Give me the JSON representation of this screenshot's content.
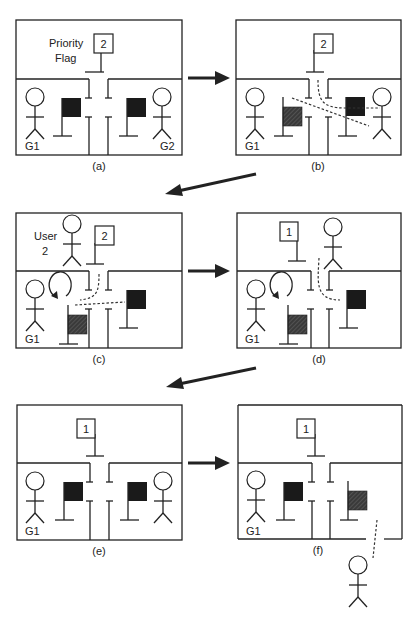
{
  "figure": {
    "panels": [
      {
        "id": "a",
        "caption": "(a)",
        "priority_flag_value": "2",
        "priority_flag_label_line1": "Priority",
        "priority_flag_label_line2": "Flag",
        "left_group_label": "G1",
        "right_group_label": "G2"
      },
      {
        "id": "b",
        "caption": "(b)",
        "priority_flag_value": "2",
        "left_group_label": "G1"
      },
      {
        "id": "c",
        "caption": "(c)",
        "priority_flag_value": "2",
        "user_label_line1": "User",
        "user_label_line2": "2",
        "left_group_label": "G1"
      },
      {
        "id": "d",
        "caption": "(d)",
        "priority_flag_value": "1",
        "left_group_label": "G1"
      },
      {
        "id": "e",
        "caption": "(e)",
        "priority_flag_value": "1",
        "left_group_label": "G1"
      },
      {
        "id": "f",
        "caption": "(f)",
        "priority_flag_value": "1",
        "left_group_label": "G1"
      }
    ],
    "colors": {
      "ink": "#222222",
      "flag_solid": "#1a1a1a",
      "flag_hatched": "#3a3a3a",
      "background": "#ffffff"
    }
  }
}
